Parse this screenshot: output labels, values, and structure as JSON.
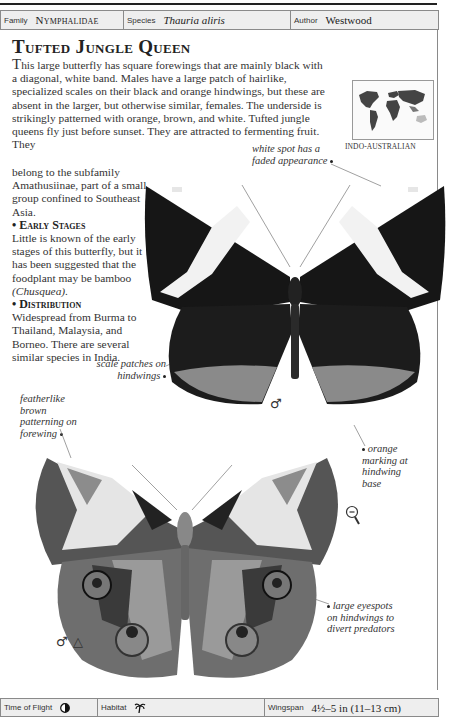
{
  "header": {
    "family_label": "Family",
    "family_value": "Nymphalidae",
    "species_label": "Species",
    "species_value": "Thauria aliris",
    "author_label": "Author",
    "author_value": "Westwood"
  },
  "entry": {
    "title": "Tufted Jungle Queen",
    "intro_first_letter": "T",
    "intro_rest": "his large butterfly has square forewings that are mainly black with a diagonal, white band. Males have a large patch of hairlike, specialized scales on their black and orange hindwings, but these are absent in the larger, but otherwise similar, females. The underside is strikingly patterned with orange, brown, and white. Tufted jungle queens fly just before sunset. They are attracted to fermenting fruit. They",
    "intro_continued": "belong to the subfamily Amathusiinae, part of a small group confined to Southeast Asia.",
    "early_stages_heading": "• Early Stages",
    "early_stages_text": "Little is known of the early stages of this butterfly, but it has been suggested that the foodplant may be bamboo",
    "early_stages_genus": "(Chusquea).",
    "distribution_heading": "• Distribution",
    "distribution_text": "Widespread from Burma to Thailand, Malaysia, and Borneo. There are several similar species in India."
  },
  "map": {
    "region_label": "INDO-AUSTRALIAN",
    "icon": "world-map-icon"
  },
  "annotations": {
    "white_spot": "white spot has a faded appearance",
    "scale_patches": "scale patches on hindwings",
    "featherlike": "featherlike brown patterning on forewing",
    "orange_marking": "orange marking at hindwing base",
    "eyespots": "large eyespots on hindwings to divert predators"
  },
  "symbols": {
    "male_upper": "♂",
    "male_lower": "♂",
    "triangle": "△",
    "magnifier_icon": "zoom-out-magnifier-icon"
  },
  "footer": {
    "time_label": "Time of Flight",
    "time_icon": "half-moon-dusk-icon",
    "habitat_label": "Habitat",
    "habitat_icon": "palm-tree-icon",
    "wingspan_label": "Wingspan",
    "wingspan_value": "4½–5 in (11–13 cm)"
  }
}
